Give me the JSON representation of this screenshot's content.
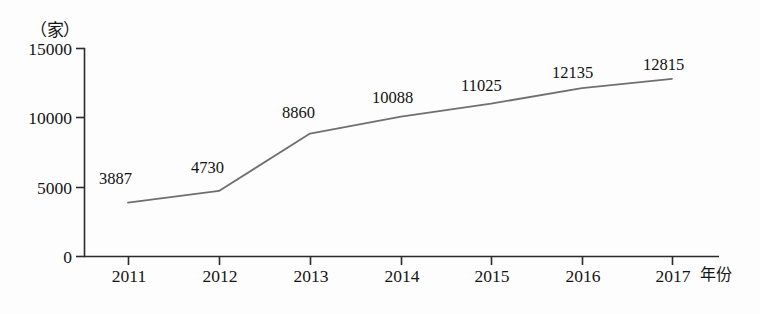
{
  "chart_data": {
    "type": "line",
    "title": "",
    "subtitle": "",
    "xlabel": "年份",
    "ylabel": "（家）",
    "categories": [
      "2011",
      "2012",
      "2013",
      "2014",
      "2015",
      "2016",
      "2017"
    ],
    "values": [
      3887,
      4730,
      8860,
      10088,
      11025,
      12135,
      12815
    ],
    "series": [
      {
        "name": "",
        "values": [
          3887,
          4730,
          8860,
          10088,
          11025,
          12135,
          12815
        ]
      }
    ],
    "point_labels": [
      "3887",
      "4730",
      "8860",
      "10088",
      "11025",
      "12135",
      "12815"
    ],
    "ylim": [
      0,
      15000
    ],
    "yticks": [
      "0",
      "5000",
      "10000",
      "15000"
    ],
    "ytick_values": [
      0,
      5000,
      10000,
      15000
    ],
    "xticks": [
      "2011",
      "2012",
      "2013",
      "2014",
      "2015",
      "2016",
      "2017"
    ],
    "grid": false,
    "legend": false,
    "legend_position": "none",
    "line_color": "#6f6f6f",
    "axis_color": "#2b2b2b",
    "text_color": "#141414",
    "background_color": "#fdfdfd"
  },
  "axes": {
    "y_unit_label": "（家）",
    "x_axis_label": "年份"
  }
}
